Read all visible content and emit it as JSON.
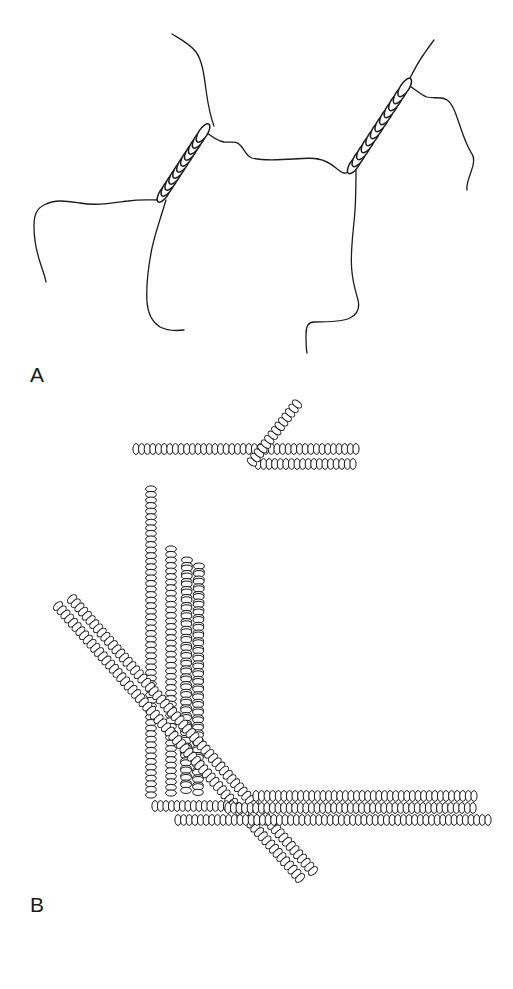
{
  "figure": {
    "type": "scientific-line-diagram",
    "background_color": "#ffffff",
    "ink_color": "#1c1c1c",
    "width": 513,
    "height": 989,
    "panels": [
      {
        "id": "A",
        "label": "A",
        "label_x": 30,
        "label_y": 364,
        "description": "Thin wavy filament traces with two coiled-coil helical segments rendered as stacks of elongated beads",
        "bead_style": {
          "rx": 9,
          "ry": 4.2,
          "stroke_width": 1.4,
          "fill": "#ffffff"
        },
        "line_stroke_width": 1.3
      },
      {
        "id": "B",
        "label": "B",
        "label_x": 30,
        "label_y": 894,
        "description": "Filament bundles drawn as chains of small subunit beads forming horizontal, vertical and diagonal strands",
        "bead_style": {
          "rx": 3.1,
          "ry": 5.4,
          "stroke_width": 1.0,
          "fill": "#ffffff"
        },
        "bead_pitch": 5.6
      }
    ]
  },
  "panel_a": {
    "label": "A",
    "coils": [
      {
        "name": "left-coil",
        "x1": 162,
        "y1": 196,
        "x2": 205,
        "y2": 130,
        "turns": 11,
        "bead_rx": 10.5,
        "bead_ry": 4.4
      },
      {
        "name": "right-coil",
        "x1": 352,
        "y1": 168,
        "x2": 407,
        "y2": 84,
        "turns": 12,
        "bead_rx": 10.5,
        "bead_ry": 4.4
      }
    ],
    "strands": [
      {
        "name": "upper-left-tail",
        "d": "M 172,34 C 182,40 190,44 196,52 C 202,60 204,74 206,90 C 208,104 210,116 214,126"
      },
      {
        "name": "left-mid-branch",
        "d": "M 160,200 C 150,200 140,199 128,201 C 112,203 96,206 80,203 C 66,201 56,199 44,205 C 36,209 34,216 34,226 C 34,238 36,250 40,262 C 43,272 45,276 46,282"
      },
      {
        "name": "left-lower-descend",
        "d": "M 166,200 C 162,214 156,230 152,248 C 148,268 146,286 147,302 C 148,315 152,322 160,327 C 168,331 176,331 184,330"
      },
      {
        "name": "center-upper-link",
        "d": "M 206,132 C 212,137 218,141 224,142 C 231,143 236,140 241,146 C 246,152 246,156 252,158 C 262,161 278,160 294,159 C 306,158 314,158 318,159"
      },
      {
        "name": "center-right-link",
        "d": "M 318,159 C 324,160 330,163 336,168 C 340,171 344,175 348,172 C 352,169 353,167 356,166"
      },
      {
        "name": "right-lower-descend",
        "d": "M 356,170 C 356,186 356,204 354,222 C 352,242 350,258 352,272 C 353,284 356,292 358,300 C 360,308 358,314 350,318 C 342,322 326,322 314,322 C 308,322 306,326 306,334 C 306,342 306,348 307,353"
      },
      {
        "name": "right-upper-tail",
        "d": "M 408,82 C 413,72 418,62 424,54 C 428,48 431,44 434,40"
      },
      {
        "name": "right-side-branch",
        "d": "M 410,86 C 416,90 421,95 427,97 C 434,99 441,96 447,100 C 453,104 456,114 460,126 C 464,138 468,148 472,154 C 475,158 474,164 471,172 C 468,180 466,186 467,190"
      }
    ]
  },
  "panel_b": {
    "label": "B",
    "filaments": [
      {
        "name": "top-horizontal-upper",
        "x1": 136,
        "y1": 449,
        "x2": 356,
        "y2": 449,
        "angle": 0
      },
      {
        "name": "top-horizontal-lower",
        "x1": 258,
        "y1": 464,
        "x2": 353,
        "y2": 464,
        "angle": 0
      },
      {
        "name": "top-right-diagonal-stub",
        "x1": 253,
        "y1": 460,
        "x2": 297,
        "y2": 404,
        "angle": -52
      },
      {
        "name": "curved-bundle-strand-1",
        "d": "bend from (268,412) down-left to (186,556) then vertical to (186,790)"
      },
      {
        "name": "curved-bundle-strand-2",
        "d": "bend from (281,424) down-left to (198,560) then vertical to (198,792)"
      },
      {
        "name": "left-vertical-long",
        "x1": 151,
        "y1": 489,
        "x2": 151,
        "y2": 795
      },
      {
        "name": "inner-vertical-1",
        "x1": 171,
        "y1": 549,
        "x2": 171,
        "y2": 793
      },
      {
        "name": "left-diagonal-strand-1",
        "x1": 58,
        "y1": 606,
        "x2": 300,
        "y2": 878
      },
      {
        "name": "left-diagonal-strand-2",
        "x1": 72,
        "y1": 600,
        "x2": 312,
        "y2": 872
      },
      {
        "name": "bottom-horizontal-left-short",
        "x1": 155,
        "y1": 806,
        "x2": 230,
        "y2": 806
      },
      {
        "name": "bottom-horizontal-upper-long",
        "x1": 258,
        "y1": 796,
        "x2": 474,
        "y2": 796
      },
      {
        "name": "bottom-horizontal-mid-long",
        "x1": 230,
        "y1": 808,
        "x2": 474,
        "y2": 808
      },
      {
        "name": "bottom-horizontal-lower-long",
        "x1": 178,
        "y1": 820,
        "x2": 488,
        "y2": 820
      }
    ]
  }
}
